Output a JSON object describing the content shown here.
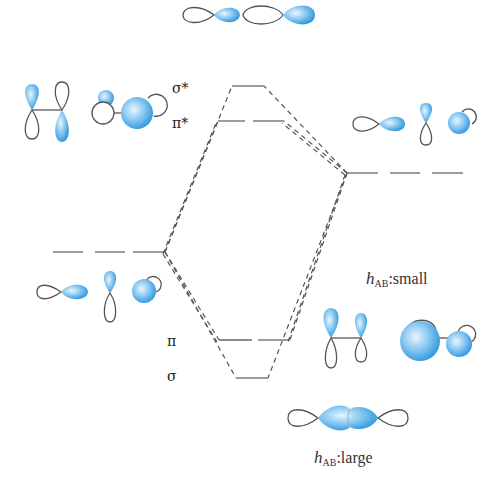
{
  "diagram": {
    "levels": {
      "sigma_star": "σ*",
      "pi_star": "π*",
      "pi": "π",
      "sigma": "σ"
    },
    "annotations": {
      "small": {
        "h": "h",
        "sub": "AB",
        "text": ":small"
      },
      "large": {
        "h": "h",
        "sub": "AB",
        "text": ":large"
      }
    },
    "colors": {
      "lobe_fill": "#4aa8e6",
      "lobe_light": "#cfe9fb",
      "line": "#555555"
    },
    "atom_orbitals": {
      "left": [
        "p-sigma",
        "p-pi",
        "p-pi-end"
      ],
      "right": [
        "p-sigma",
        "p-pi",
        "p-pi-end"
      ]
    }
  }
}
